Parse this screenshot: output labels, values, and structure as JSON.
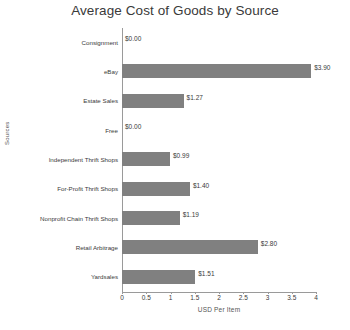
{
  "chart_data": {
    "type": "bar",
    "orientation": "horizontal",
    "title": "Average Cost of Goods by Source",
    "xlabel": "USD Per Item",
    "ylabel": "Sources",
    "xlim": [
      0,
      4
    ],
    "xticks": [
      "0",
      "0.5",
      "1",
      "1.5",
      "2",
      "2.5",
      "3",
      "3.5",
      "4"
    ],
    "xtick_values": [
      0,
      0.5,
      1,
      1.5,
      2,
      2.5,
      3,
      3.5,
      4
    ],
    "grid": false,
    "legend": null,
    "bar_color": "#808080",
    "categories": [
      "Consignment",
      "eBay",
      "Estate Sales",
      "Free",
      "Independent Thrift Shops",
      "For-Profit Thrift Shops",
      "Nonprofit Chain Thrift Shops",
      "Retail Arbitrage",
      "Yardsales"
    ],
    "values": [
      0.0,
      3.9,
      1.27,
      0.0,
      0.99,
      1.4,
      1.19,
      2.8,
      1.51
    ],
    "data_labels": [
      "$0.00",
      "$3.90",
      "$1.27",
      "$0.00",
      "$0.99",
      "$1.40",
      "$1.19",
      "$2.80",
      "$1.51"
    ]
  }
}
